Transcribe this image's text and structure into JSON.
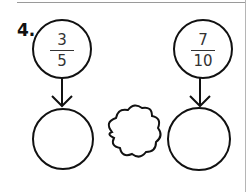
{
  "question": {
    "number": "4."
  },
  "fractions": [
    {
      "numerator": "3",
      "denominator": "5"
    },
    {
      "numerator": "7",
      "denominator": "10"
    }
  ],
  "answer_circles": [
    "",
    ""
  ],
  "comparison_cloud": ""
}
